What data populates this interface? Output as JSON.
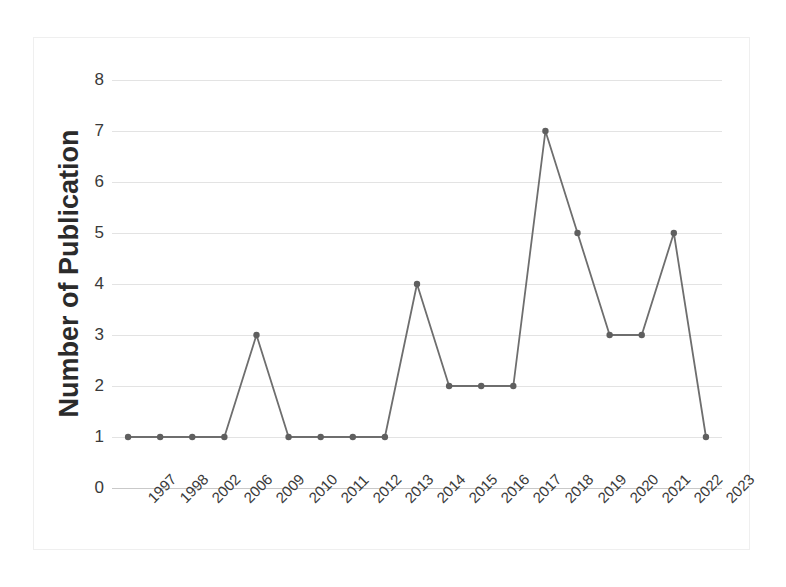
{
  "chart_data": {
    "type": "line",
    "title": "",
    "xlabel": "",
    "ylabel": "Number of Publication",
    "categories": [
      "1997",
      "1998",
      "2002",
      "2006",
      "2009",
      "2010",
      "2011",
      "2012",
      "2013",
      "2014",
      "2015",
      "2016",
      "2017",
      "2018",
      "2019",
      "2020",
      "2021",
      "2022",
      "2023"
    ],
    "values": [
      1,
      1,
      1,
      1,
      3,
      1,
      1,
      1,
      1,
      4,
      2,
      2,
      2,
      7,
      5,
      3,
      3,
      5,
      1
    ],
    "series": [
      {
        "name": "Number of Publication",
        "values": [
          1,
          1,
          1,
          1,
          3,
          1,
          1,
          1,
          1,
          4,
          2,
          2,
          2,
          7,
          5,
          3,
          3,
          5,
          1
        ]
      }
    ],
    "ylim": [
      0,
      8
    ],
    "y_ticks": [
      0,
      1,
      2,
      3,
      4,
      5,
      6,
      7,
      8
    ],
    "y_tick_labels": [
      "0",
      "1",
      "2",
      "3",
      "4",
      "5",
      "6",
      "7",
      "8"
    ],
    "grid": true,
    "legend": "none",
    "marker": "circle",
    "line_color": "#6e6e6e",
    "marker_color": "#5f5f5f",
    "grid_color": "#e3e3e3",
    "background_color": "#ffffff",
    "text_color": "#3a3a3a",
    "x_tick_rotation": -45
  }
}
